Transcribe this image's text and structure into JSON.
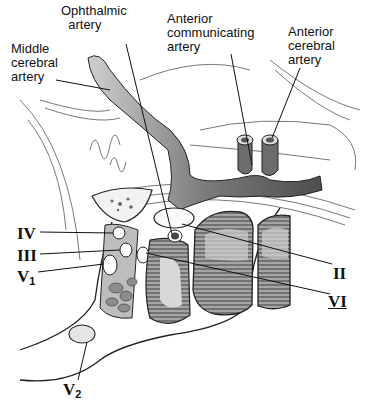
{
  "figure": {
    "width": 366,
    "height": 406,
    "colors": {
      "background": "#ffffff",
      "ink": "#111111",
      "artery_fill": "#8a8a8a",
      "muscle_fill": "#9a9a9a",
      "pale_fill": "#e6e6e6"
    }
  },
  "labels": {
    "ophthalmic_artery": "Ophthalmic\n  artery",
    "middle_cerebral_artery": "Middle\ncerebral\nartery",
    "anterior_communicating_artery": "Anterior\ncommunicating\nartery",
    "anterior_cerebral_artery": "Anterior\ncerebral\nartery",
    "cn_iv": "IV",
    "cn_iii": "III",
    "cn_v1_main": "V",
    "cn_v1_sub": "1",
    "cn_ii": "II",
    "cn_vi": "VI",
    "cn_v2_main": "V",
    "cn_v2_sub": "2"
  }
}
